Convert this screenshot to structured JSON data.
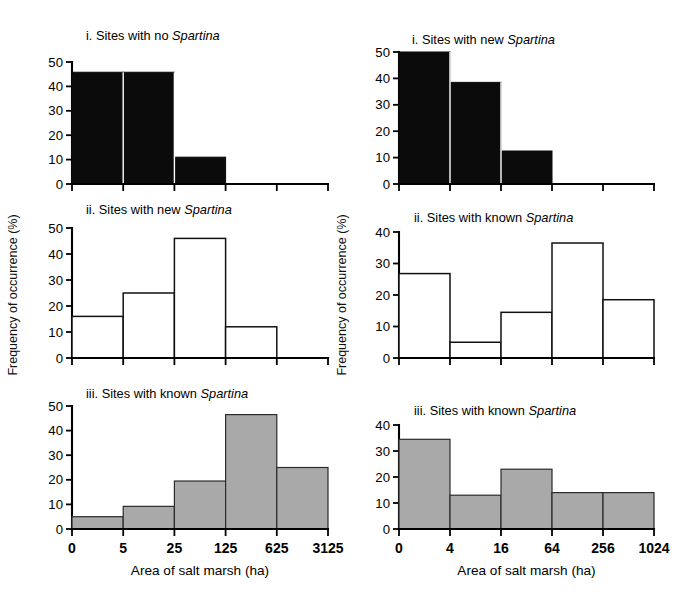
{
  "figure": {
    "width": 695,
    "height": 600,
    "background": "#ffffff",
    "axis_color": "#000000",
    "colors": {
      "black_fill": "#0b0b0b",
      "white_fill": "#ffffff",
      "gray_fill": "#a9a9a9",
      "outline": "#111111"
    },
    "y_axis_label_left": "Frequency of occurrence (%)",
    "y_axis_label_right": "Frequency of occurrence (%)"
  },
  "chart_data": [
    {
      "id": "panel-top-left",
      "type": "bar",
      "title": "i. Sites with no Spartina",
      "title_plain": "i. Sites with no ",
      "title_italic": "Spartina",
      "xlabel": "",
      "ylabel": "Frequency of occurrence (%)",
      "categories": [
        "0-5",
        "5-25",
        "25-125",
        "125-625",
        "625-3125"
      ],
      "xtick_labels": [
        "0",
        "5",
        "25",
        "125",
        "625",
        "3125"
      ],
      "values": [
        45.8,
        45.8,
        11.0,
        0.0,
        0.0
      ],
      "ytick_labels": [
        "0",
        "10",
        "20",
        "30",
        "40",
        "50"
      ],
      "yticks": [
        0,
        10,
        20,
        30,
        40,
        50
      ],
      "ylim": [
        0,
        50
      ],
      "fill_style": "black",
      "grid": false,
      "legend": "none"
    },
    {
      "id": "panel-top-right",
      "type": "bar",
      "title": "i. Sites with new Spartina",
      "title_plain": "i. Sites with new ",
      "title_italic": "Spartina",
      "xlabel": "",
      "ylabel": "Frequency of occurrence (%)",
      "categories": [
        "0-4",
        "4-16",
        "16-64",
        "64-256",
        "256-1024"
      ],
      "xtick_labels": [
        "0",
        "4",
        "16",
        "64",
        "256",
        "1024"
      ],
      "values": [
        50.0,
        38.5,
        12.5,
        0.0,
        0.0
      ],
      "ytick_labels": [
        "0",
        "10",
        "20",
        "30",
        "40",
        "50"
      ],
      "yticks": [
        0,
        10,
        20,
        30,
        40,
        50
      ],
      "ylim": [
        0,
        50
      ],
      "fill_style": "black",
      "grid": false,
      "legend": "none"
    },
    {
      "id": "panel-mid-left",
      "type": "bar",
      "title": "ii. Sites with new Spartina",
      "title_plain": "ii. Sites with new ",
      "title_italic": "Spartina",
      "xlabel": "",
      "ylabel": "Frequency of occurrence (%)",
      "categories": [
        "0-5",
        "5-25",
        "25-125",
        "125-625",
        "625-3125"
      ],
      "xtick_labels": [
        "0",
        "5",
        "25",
        "125",
        "625",
        "3125"
      ],
      "values": [
        16.0,
        25.0,
        46.0,
        12.0,
        0.0
      ],
      "ytick_labels": [
        "0",
        "10",
        "20",
        "30",
        "40",
        "50"
      ],
      "yticks": [
        0,
        10,
        20,
        30,
        40,
        50
      ],
      "ylim": [
        0,
        50
      ],
      "fill_style": "white",
      "grid": false,
      "legend": "none"
    },
    {
      "id": "panel-mid-right",
      "type": "bar",
      "title": "ii. Sites with known Spartina",
      "title_plain": "ii. Sites with known ",
      "title_italic": "Spartina",
      "xlabel": "",
      "ylabel": "Frequency of occurrence (%)",
      "categories": [
        "0-4",
        "4-16",
        "16-64",
        "64-256",
        "256-1024"
      ],
      "xtick_labels": [
        "0",
        "4",
        "16",
        "64",
        "256",
        "1024"
      ],
      "values": [
        26.8,
        5.0,
        14.5,
        36.5,
        18.5
      ],
      "ytick_labels": [
        "0",
        "10",
        "20",
        "30",
        "40"
      ],
      "yticks": [
        0,
        10,
        20,
        30,
        40
      ],
      "ylim": [
        0,
        40
      ],
      "fill_style": "white",
      "grid": false,
      "legend": "none"
    },
    {
      "id": "panel-bot-left",
      "type": "bar",
      "title": "iii. Sites with known Spartina",
      "title_plain": "iii. Sites with known ",
      "title_italic": "Spartina",
      "xlabel": "Area of salt marsh (ha)",
      "ylabel": "Frequency of occurrence (%)",
      "categories": [
        "0-5",
        "5-25",
        "25-125",
        "125-625",
        "625-3125"
      ],
      "xtick_labels": [
        "0",
        "5",
        "25",
        "125",
        "625",
        "3125"
      ],
      "values": [
        5.0,
        9.2,
        19.5,
        46.5,
        25.0
      ],
      "ytick_labels": [
        "0",
        "10",
        "20",
        "30",
        "40",
        "50"
      ],
      "yticks": [
        0,
        10,
        20,
        30,
        40,
        50
      ],
      "ylim": [
        0,
        50
      ],
      "fill_style": "gray",
      "grid": false,
      "legend": "none"
    },
    {
      "id": "panel-bot-right",
      "type": "bar",
      "title": "iii. Sites with known Spartina",
      "title_plain": "iii. Sites with known ",
      "title_italic": "Spartina",
      "xlabel": "Area of salt marsh (ha)",
      "ylabel": "Frequency of occurrence (%)",
      "categories": [
        "0-4",
        "4-16",
        "16-64",
        "64-256",
        "256-1024"
      ],
      "xtick_labels": [
        "0",
        "4",
        "16",
        "64",
        "256",
        "1024"
      ],
      "values": [
        34.5,
        13.0,
        23.0,
        14.0,
        14.0
      ],
      "ytick_labels": [
        "0",
        "10",
        "20",
        "30",
        "40"
      ],
      "yticks": [
        0,
        10,
        20,
        30,
        40
      ],
      "ylim": [
        0,
        40
      ],
      "fill_style": "gray",
      "grid": false,
      "legend": "none"
    }
  ]
}
